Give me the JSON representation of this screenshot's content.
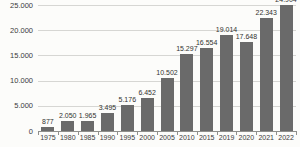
{
  "chart_data": {
    "type": "bar",
    "categories": [
      "1975",
      "1980",
      "1985",
      "1990",
      "1995",
      "2000",
      "2005",
      "2010",
      "2015",
      "2019",
      "2020",
      "2021",
      "2022"
    ],
    "values": [
      877,
      2050,
      1965,
      3495,
      5176,
      6452,
      10502,
      15297,
      16554,
      19014,
      17648,
      22343,
      24904
    ],
    "value_labels": [
      "877",
      "2.050",
      "1.965",
      "3.495",
      "5.176",
      "6.452",
      "10.502",
      "15.297",
      "16.554",
      "19.014",
      "17.648",
      "22.343",
      "24.904"
    ],
    "title": "",
    "xlabel": "",
    "ylabel": "",
    "ylim": [
      0,
      25000
    ],
    "yticks": [
      0,
      5000,
      10000,
      15000,
      20000,
      25000
    ],
    "ytick_labels": [
      "0",
      "5.000",
      "10.000",
      "15.000",
      "20.000",
      "25.000"
    ],
    "grid": true,
    "legend": false,
    "colors": {
      "bar": "#6a6a6a",
      "grid": "#d6d6d3",
      "axis": "#8f8f8c",
      "text": "#3b3b3b",
      "background": "#fcfcfa"
    }
  }
}
